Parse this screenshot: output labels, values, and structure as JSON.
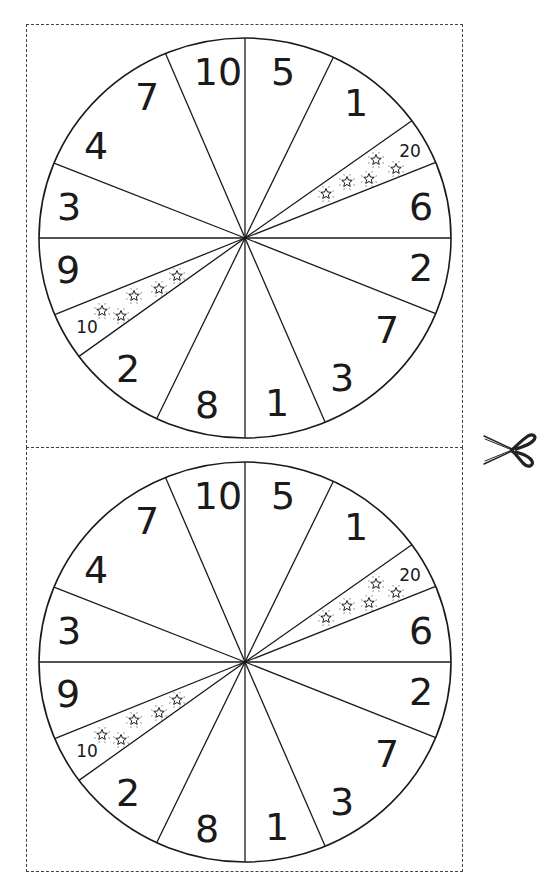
{
  "sheet": {
    "title": "Spinner wheel cut-out sheet",
    "cut_line_icon": "scissors-icon"
  },
  "wheel_template": {
    "spoke_angles_deg": [
      -90,
      -64.6,
      -35.9,
      -22.2,
      0,
      22.2,
      67.1,
      90,
      115.4,
      143.7,
      157.5,
      180,
      202,
      247.3
    ],
    "segments": [
      {
        "label": "10",
        "x": 218,
        "y": 72,
        "size": "large"
      },
      {
        "label": "5",
        "x": 283,
        "y": 72,
        "size": "large"
      },
      {
        "label": "1",
        "x": 356,
        "y": 103,
        "size": "large"
      },
      {
        "label": "20",
        "x": 410,
        "y": 151,
        "size": "small",
        "bonus": true
      },
      {
        "label": "6",
        "x": 421,
        "y": 207,
        "size": "large"
      },
      {
        "label": "2",
        "x": 421,
        "y": 268,
        "size": "large"
      },
      {
        "label": "7",
        "x": 387,
        "y": 330,
        "size": "large"
      },
      {
        "label": "3",
        "x": 342,
        "y": 378,
        "size": "large"
      },
      {
        "label": "1",
        "x": 277,
        "y": 403,
        "size": "large"
      },
      {
        "label": "8",
        "x": 207,
        "y": 405,
        "size": "large"
      },
      {
        "label": "2",
        "x": 128,
        "y": 369,
        "size": "large"
      },
      {
        "label": "10",
        "x": 87,
        "y": 327,
        "size": "small",
        "bonus": true
      },
      {
        "label": "9",
        "x": 68,
        "y": 270,
        "size": "large"
      },
      {
        "label": "3",
        "x": 69,
        "y": 207,
        "size": "large"
      },
      {
        "label": "4",
        "x": 96,
        "y": 146,
        "size": "large"
      },
      {
        "label": "7",
        "x": 147,
        "y": 97,
        "size": "large"
      }
    ],
    "bonus_stars": {
      "wedge_20": [
        [
          326,
          194
        ],
        [
          347,
          182
        ],
        [
          369,
          179
        ],
        [
          376,
          160
        ],
        [
          396,
          169
        ]
      ],
      "wedge_10": [
        [
          102,
          311
        ],
        [
          121,
          316
        ],
        [
          134,
          296
        ],
        [
          159,
          289
        ],
        [
          177,
          276
        ]
      ]
    }
  },
  "wheels": [
    {
      "name": "wheel-top",
      "cx": 245,
      "cy": 238,
      "rx": 206,
      "ry": 200,
      "offset_y": 0
    },
    {
      "name": "wheel-bottom",
      "cx": 245,
      "cy": 662,
      "rx": 206,
      "ry": 200,
      "offset_y": 424
    }
  ],
  "colors": {
    "line": "#1a1a1a",
    "dash": "#444444",
    "paper": "#ffffff"
  }
}
